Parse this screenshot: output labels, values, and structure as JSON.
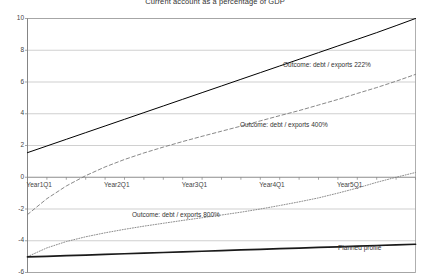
{
  "chart_data": {
    "type": "line",
    "title": "Current account as a percentage of GDP",
    "xlabel": "",
    "ylabel": "",
    "ylim": [
      -6,
      10
    ],
    "yticks": [
      -6,
      -4,
      -2,
      0,
      2,
      4,
      6,
      8,
      10
    ],
    "ytick_labels": [
      "-6",
      "-4",
      "-2",
      "0",
      "2",
      "4",
      "6",
      "8",
      "10"
    ],
    "grid": true,
    "legend_position": "inline-annotations",
    "x": [
      0,
      1,
      2,
      3,
      4,
      5,
      6,
      7,
      8,
      9,
      10,
      11,
      12,
      13,
      14,
      15,
      16,
      17,
      18,
      19,
      20
    ],
    "xtick_labels": [
      "Year1Q1",
      "Year2Q1",
      "Year3Q1",
      "Year4Q1",
      "Year5Q1"
    ],
    "xtick_positions": [
      0,
      4,
      8,
      12,
      16
    ],
    "series": [
      {
        "name": "Outcome: debt / exports 222%",
        "style": "solid",
        "color": "#000000",
        "width": 1.0,
        "values": [
          1.55,
          1.97,
          2.39,
          2.81,
          3.23,
          3.65,
          4.07,
          4.49,
          4.91,
          5.33,
          5.75,
          6.17,
          6.59,
          7.01,
          7.43,
          7.85,
          8.27,
          8.69,
          9.11,
          9.55,
          10.0
        ]
      },
      {
        "name": "Outcome: debt / exports 400%",
        "style": "dashed",
        "color": "#7a7a7a",
        "width": 0.9,
        "values": [
          -2.35,
          -1.35,
          -0.55,
          0.1,
          0.65,
          1.12,
          1.53,
          1.9,
          2.25,
          2.58,
          2.9,
          3.22,
          3.55,
          3.88,
          4.2,
          4.55,
          4.9,
          5.28,
          5.65,
          6.05,
          6.48
        ]
      },
      {
        "name": "Outcome: debt / exports 800%",
        "style": "dotted",
        "color": "#808080",
        "width": 0.9,
        "values": [
          -5.0,
          -4.45,
          -4.05,
          -3.75,
          -3.5,
          -3.28,
          -3.08,
          -2.9,
          -2.72,
          -2.55,
          -2.38,
          -2.2,
          -2.0,
          -1.78,
          -1.55,
          -1.3,
          -1.0,
          -0.68,
          -0.32,
          0.0,
          0.3
        ]
      },
      {
        "name": "Planned profile",
        "style": "solid",
        "color": "#1a1a1a",
        "width": 1.7,
        "values": [
          -5.02,
          -4.98,
          -4.94,
          -4.9,
          -4.86,
          -4.82,
          -4.78,
          -4.74,
          -4.7,
          -4.66,
          -4.62,
          -4.58,
          -4.54,
          -4.5,
          -4.46,
          -4.42,
          -4.38,
          -4.34,
          -4.3,
          -4.26,
          -4.22
        ]
      }
    ],
    "annotations": [
      {
        "text": "Outcome: debt / exports 222%",
        "x_px": 283,
        "y_px": 61
      },
      {
        "text": "Outcome: debt / exports 400%",
        "x_px": 240,
        "y_px": 121
      },
      {
        "text": "Outcome: debt / exports 800%",
        "x_px": 132,
        "y_px": 211
      },
      {
        "text": "Planned profile",
        "x_px": 338,
        "y_px": 244
      }
    ]
  },
  "colors": {
    "axis": "#808080",
    "grid": "#b0b0b0",
    "frame": "#9a9a9a",
    "text": "#333333",
    "background": "#ffffff"
  }
}
